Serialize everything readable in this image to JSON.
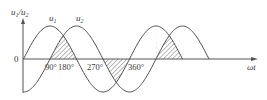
{
  "figure": {
    "y_axis_label": "u",
    "y_axis_label_sub1": "1",
    "y_axis_label_sep": "/u",
    "y_axis_label_sub2": "2",
    "x_axis_label": "ωt",
    "origin_label": "0",
    "curve_labels": [
      {
        "name": "u",
        "sub": "1"
      },
      {
        "name": "u",
        "sub": "2"
      }
    ],
    "tick_labels": [
      "90°",
      "180°",
      "270°",
      "360°"
    ],
    "colors": {
      "line": "#4a4a4a",
      "axis": "#555555",
      "hatch": "#555555"
    }
  },
  "chart_data": {
    "type": "line",
    "title": "",
    "xlabel": "ωt",
    "ylabel": "u1/u2",
    "x_unit": "degrees",
    "x_ticks_labeled": [
      90,
      180,
      270,
      360
    ],
    "series": [
      {
        "name": "u1",
        "function": "sin(ωt)",
        "phase_deg": 0,
        "amplitude": 1,
        "domain_deg": [
          0,
          540
        ]
      },
      {
        "name": "u2",
        "function": "sin(ωt - 90°)",
        "phase_deg": -90,
        "amplitude": 1,
        "domain_deg": [
          0,
          630
        ]
      }
    ],
    "hatched_regions_deg": [
      [
        90,
        180
      ],
      [
        270,
        360
      ],
      [
        450,
        540
      ]
    ],
    "grid": false,
    "legend": "inline curve labels"
  }
}
